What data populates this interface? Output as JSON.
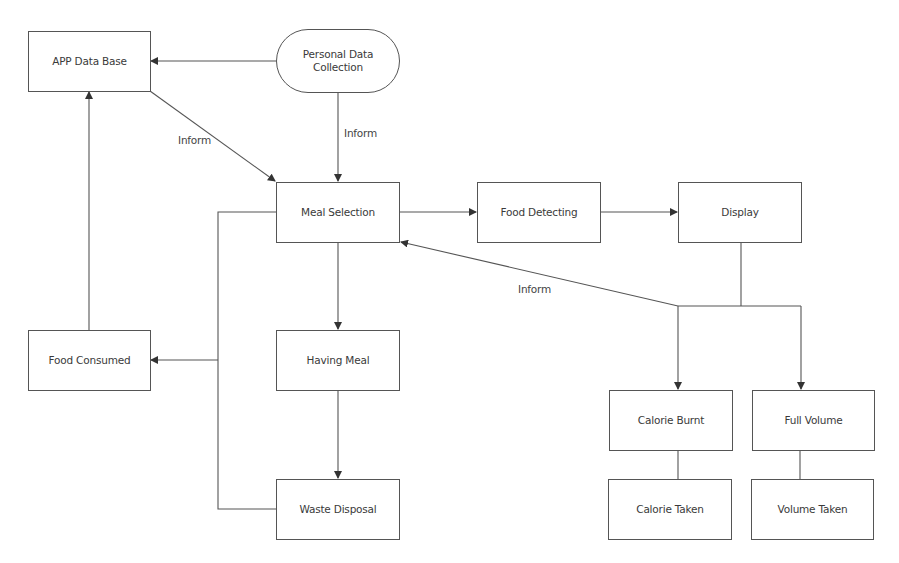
{
  "diagram": {
    "type": "flowchart",
    "nodes": {
      "app_db": {
        "label": "APP Data Base",
        "shape": "rectangle"
      },
      "personal": {
        "label": "Personal Data\nCollection",
        "line1": "Personal Data",
        "line2": "Collection",
        "shape": "rounded"
      },
      "meal_selection": {
        "label": "Meal Selection",
        "shape": "rectangle"
      },
      "food_detecting": {
        "label": "Food Detecting",
        "shape": "rectangle"
      },
      "display": {
        "label": "Display",
        "shape": "rectangle"
      },
      "food_consumed": {
        "label": "Food Consumed",
        "shape": "rectangle"
      },
      "having_meal": {
        "label": "Having Meal",
        "shape": "rectangle"
      },
      "waste_disposal": {
        "label": "Waste Disposal",
        "shape": "rectangle"
      },
      "calorie_burnt": {
        "label": "Calorie Burnt",
        "shape": "rectangle"
      },
      "full_volume": {
        "label": "Full Volume",
        "shape": "rectangle"
      },
      "calorie_taken": {
        "label": "Calorie Taken",
        "shape": "rectangle"
      },
      "volume_taken": {
        "label": "Volume Taken",
        "shape": "rectangle"
      }
    },
    "edge_labels": {
      "db_to_meal": "Inform",
      "personal_to_meal": "Inform",
      "display_to_meal": "Inform"
    },
    "edges": [
      {
        "from": "Personal Data Collection",
        "to": "APP Data Base",
        "label": ""
      },
      {
        "from": "Personal Data Collection",
        "to": "Meal Selection",
        "label": "Inform"
      },
      {
        "from": "APP Data Base",
        "to": "Meal Selection",
        "label": "Inform"
      },
      {
        "from": "Meal Selection",
        "to": "Food Detecting",
        "label": ""
      },
      {
        "from": "Food Detecting",
        "to": "Display",
        "label": ""
      },
      {
        "from": "Display",
        "to": "Meal Selection",
        "label": "Inform"
      },
      {
        "from": "Display",
        "to": "Calorie Burnt",
        "label": ""
      },
      {
        "from": "Display",
        "to": "Full Volume",
        "label": ""
      },
      {
        "from": "Calorie Burnt",
        "to": "Calorie Taken",
        "label": "",
        "arrow": false
      },
      {
        "from": "Full Volume",
        "to": "Volume Taken",
        "label": "",
        "arrow": false
      },
      {
        "from": "Meal Selection",
        "to": "Having Meal",
        "label": ""
      },
      {
        "from": "Having Meal",
        "to": "Waste Disposal",
        "label": ""
      },
      {
        "from": "Meal Selection",
        "to": "Food Consumed",
        "label": ""
      },
      {
        "from": "Waste Disposal",
        "to": "Food Consumed",
        "label": ""
      },
      {
        "from": "Food Consumed",
        "to": "APP Data Base",
        "label": ""
      }
    ],
    "colors": {
      "stroke": "#555555",
      "text": "#3a3a3a",
      "background": "#ffffff"
    }
  }
}
